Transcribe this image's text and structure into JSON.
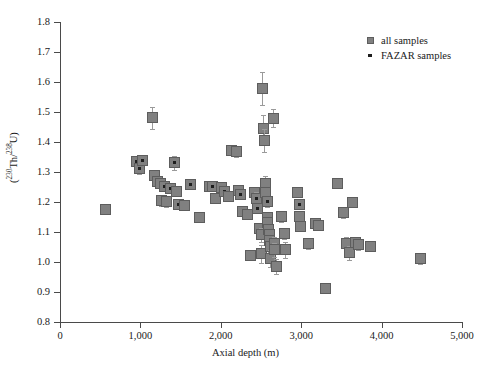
{
  "chart_data": {
    "type": "scatter",
    "title": "",
    "xlabel": "Axial depth (m)",
    "ylabel": "(230Th/238U)",
    "ylabel_parts": {
      "open": "(",
      "sup1": "230",
      "mid1": "Th/",
      "sup2": "238",
      "mid2": "U",
      "close": ")"
    },
    "xlim": [
      0,
      5000
    ],
    "ylim": [
      0.8,
      1.8
    ],
    "xticks": [
      0,
      1000,
      2000,
      3000,
      4000,
      5000
    ],
    "xtick_labels": [
      "0",
      "1,000",
      "2,000",
      "3,000",
      "4,000",
      "5,000"
    ],
    "yticks": [
      0.8,
      0.9,
      1.0,
      1.1,
      1.2,
      1.3,
      1.4,
      1.5,
      1.6,
      1.7,
      1.8
    ],
    "ytick_labels": [
      "0.8",
      "0.9",
      "1.0",
      "1.1",
      "1.2",
      "1.3",
      "1.4",
      "1.5",
      "1.6",
      "1.7",
      "1.8"
    ],
    "grid": false,
    "legend_position": "top-right",
    "marker_color": "#808080",
    "marker_edge_color": "#5d5d5d",
    "errorbar_color": "#9a9a9a",
    "fazar_dot_color": "#1e1e1e",
    "series": [
      {
        "name": "all samples",
        "marker": "square",
        "points": [
          {
            "x": 560,
            "y": 1.175,
            "yerr": 0.012,
            "fazar": false
          },
          {
            "x": 955,
            "y": 1.335,
            "yerr": 0.018,
            "fazar": true
          },
          {
            "x": 985,
            "y": 1.31,
            "yerr": 0.016,
            "fazar": true
          },
          {
            "x": 1030,
            "y": 1.337,
            "yerr": 0.014,
            "fazar": true
          },
          {
            "x": 1150,
            "y": 1.48,
            "yerr": 0.038,
            "fazar": false
          },
          {
            "x": 1180,
            "y": 1.288,
            "yerr": 0.016,
            "fazar": false
          },
          {
            "x": 1215,
            "y": 1.268,
            "yerr": 0.015,
            "fazar": true
          },
          {
            "x": 1255,
            "y": 1.262,
            "yerr": 0.013,
            "fazar": true
          },
          {
            "x": 1265,
            "y": 1.205,
            "yerr": 0.018,
            "fazar": false
          },
          {
            "x": 1300,
            "y": 1.253,
            "yerr": 0.014,
            "fazar": true
          },
          {
            "x": 1320,
            "y": 1.2,
            "yerr": 0.016,
            "fazar": false
          },
          {
            "x": 1380,
            "y": 1.245,
            "yerr": 0.016,
            "fazar": true
          },
          {
            "x": 1430,
            "y": 1.33,
            "yerr": 0.022,
            "fazar": true
          },
          {
            "x": 1450,
            "y": 1.235,
            "yerr": 0.014,
            "fazar": false
          },
          {
            "x": 1480,
            "y": 1.192,
            "yerr": 0.014,
            "fazar": true
          },
          {
            "x": 1545,
            "y": 1.188,
            "yerr": 0.013,
            "fazar": false
          },
          {
            "x": 1620,
            "y": 1.258,
            "yerr": 0.016,
            "fazar": true
          },
          {
            "x": 1740,
            "y": 1.148,
            "yerr": 0.014,
            "fazar": false
          },
          {
            "x": 1855,
            "y": 1.253,
            "yerr": 0.016,
            "fazar": true
          },
          {
            "x": 1900,
            "y": 1.252,
            "yerr": 0.013,
            "fazar": true
          },
          {
            "x": 1930,
            "y": 1.212,
            "yerr": 0.014,
            "fazar": false
          },
          {
            "x": 2010,
            "y": 1.248,
            "yerr": 0.016,
            "fazar": true
          },
          {
            "x": 2050,
            "y": 1.235,
            "yerr": 0.014,
            "fazar": true
          },
          {
            "x": 2090,
            "y": 1.218,
            "yerr": 0.016,
            "fazar": false
          },
          {
            "x": 2130,
            "y": 1.37,
            "yerr": 0.014,
            "fazar": false
          },
          {
            "x": 2200,
            "y": 1.368,
            "yerr": 0.018,
            "fazar": false
          },
          {
            "x": 2215,
            "y": 1.238,
            "yerr": 0.013,
            "fazar": true
          },
          {
            "x": 2250,
            "y": 1.225,
            "yerr": 0.014,
            "fazar": true
          },
          {
            "x": 2270,
            "y": 1.168,
            "yerr": 0.014,
            "fazar": false
          },
          {
            "x": 2330,
            "y": 1.158,
            "yerr": 0.015,
            "fazar": false
          },
          {
            "x": 2370,
            "y": 1.022,
            "yerr": 0.016,
            "fazar": false
          },
          {
            "x": 2420,
            "y": 1.232,
            "yerr": 0.016,
            "fazar": false
          },
          {
            "x": 2450,
            "y": 1.212,
            "yerr": 0.02,
            "fazar": true
          },
          {
            "x": 2460,
            "y": 1.178,
            "yerr": 0.014,
            "fazar": true
          },
          {
            "x": 2480,
            "y": 1.112,
            "yerr": 0.018,
            "fazar": false
          },
          {
            "x": 2500,
            "y": 1.09,
            "yerr": 0.024,
            "fazar": false
          },
          {
            "x": 2505,
            "y": 1.028,
            "yerr": 0.03,
            "fazar": false
          },
          {
            "x": 2520,
            "y": 1.58,
            "yerr": 0.055,
            "fazar": false
          },
          {
            "x": 2525,
            "y": 1.445,
            "yerr": 0.045,
            "fazar": false
          },
          {
            "x": 2540,
            "y": 1.405,
            "yerr": 0.038,
            "fazar": false
          },
          {
            "x": 2555,
            "y": 1.262,
            "yerr": 0.026,
            "fazar": false
          },
          {
            "x": 2560,
            "y": 1.23,
            "yerr": 0.016,
            "fazar": false
          },
          {
            "x": 2575,
            "y": 1.2,
            "yerr": 0.018,
            "fazar": true
          },
          {
            "x": 2580,
            "y": 1.148,
            "yerr": 0.014,
            "fazar": false
          },
          {
            "x": 2585,
            "y": 1.132,
            "yerr": 0.014,
            "fazar": false
          },
          {
            "x": 2595,
            "y": 1.108,
            "yerr": 0.016,
            "fazar": false
          },
          {
            "x": 2600,
            "y": 1.09,
            "yerr": 0.014,
            "fazar": false
          },
          {
            "x": 2605,
            "y": 1.07,
            "yerr": 0.018,
            "fazar": false
          },
          {
            "x": 2615,
            "y": 1.052,
            "yerr": 0.018,
            "fazar": false
          },
          {
            "x": 2620,
            "y": 1.012,
            "yerr": 0.028,
            "fazar": false
          },
          {
            "x": 2660,
            "y": 1.48,
            "yerr": 0.03,
            "fazar": false
          },
          {
            "x": 2665,
            "y": 1.062,
            "yerr": 0.02,
            "fazar": false
          },
          {
            "x": 2670,
            "y": 1.04,
            "yerr": 0.022,
            "fazar": false
          },
          {
            "x": 2690,
            "y": 0.985,
            "yerr": 0.026,
            "fazar": false
          },
          {
            "x": 2760,
            "y": 1.15,
            "yerr": 0.018,
            "fazar": false
          },
          {
            "x": 2790,
            "y": 1.095,
            "yerr": 0.018,
            "fazar": false
          },
          {
            "x": 2805,
            "y": 1.04,
            "yerr": 0.026,
            "fazar": false
          },
          {
            "x": 2960,
            "y": 1.23,
            "yerr": 0.014,
            "fazar": false
          },
          {
            "x": 2975,
            "y": 1.192,
            "yerr": 0.014,
            "fazar": true
          },
          {
            "x": 2985,
            "y": 1.152,
            "yerr": 0.014,
            "fazar": false
          },
          {
            "x": 2995,
            "y": 1.118,
            "yerr": 0.014,
            "fazar": false
          },
          {
            "x": 3090,
            "y": 1.062,
            "yerr": 0.018,
            "fazar": false
          },
          {
            "x": 3180,
            "y": 1.128,
            "yerr": 0.014,
            "fazar": false
          },
          {
            "x": 3215,
            "y": 1.122,
            "yerr": 0.014,
            "fazar": false
          },
          {
            "x": 3300,
            "y": 0.912,
            "yerr": 0.014,
            "fazar": false
          },
          {
            "x": 3455,
            "y": 1.262,
            "yerr": 0.016,
            "fazar": false
          },
          {
            "x": 3520,
            "y": 1.165,
            "yerr": 0.018,
            "fazar": false
          },
          {
            "x": 3560,
            "y": 1.06,
            "yerr": 0.022,
            "fazar": false
          },
          {
            "x": 3600,
            "y": 1.03,
            "yerr": 0.024,
            "fazar": false
          },
          {
            "x": 3640,
            "y": 1.198,
            "yerr": 0.014,
            "fazar": false
          },
          {
            "x": 3680,
            "y": 1.065,
            "yerr": 0.02,
            "fazar": false
          },
          {
            "x": 3710,
            "y": 1.058,
            "yerr": 0.018,
            "fazar": false
          },
          {
            "x": 3860,
            "y": 1.052,
            "yerr": 0.016,
            "fazar": false
          },
          {
            "x": 4490,
            "y": 1.012,
            "yerr": 0.018,
            "fazar": false
          }
        ]
      }
    ],
    "legend": [
      {
        "label": "all samples",
        "key": "square-marker"
      },
      {
        "label": "FAZAR samples",
        "key": "dot-marker"
      }
    ]
  }
}
